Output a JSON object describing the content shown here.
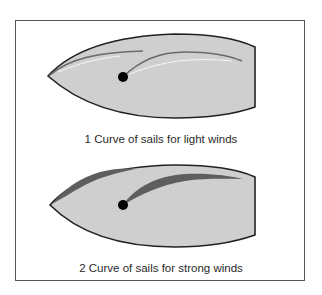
{
  "figures": [
    {
      "id": 1,
      "caption": "1 Curve of sails for light winds",
      "condition": "light winds"
    },
    {
      "id": 2,
      "caption": "2 Curve of sails for strong winds",
      "condition": "strong winds"
    }
  ],
  "colors": {
    "hull_fill": "#cfcfcf",
    "hull_outline": "#222222",
    "sail": "#6a6a6a",
    "mast": "#000000",
    "frame": "#555555"
  }
}
